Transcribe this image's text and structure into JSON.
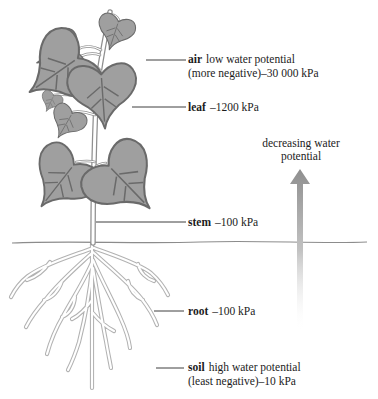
{
  "diagram": {
    "arrow_label": {
      "line1": "decreasing water",
      "line2": "potential"
    },
    "labels": {
      "air": {
        "term": "air",
        "rest": "low water potential",
        "line2": "(more negative)–30 000 kPa"
      },
      "leaf": {
        "term": "leaf",
        "rest": "–1200 kPa"
      },
      "stem": {
        "term": "stem",
        "rest": "–100 kPa"
      },
      "root": {
        "term": "root",
        "rest": "–100 kPa"
      },
      "soil": {
        "term": "soil",
        "rest": "high water potential",
        "line2": "(least negative)–10 kPa"
      }
    },
    "colors": {
      "background": "#ffffff",
      "leaf_fill": "#9f9f9f",
      "leaf_outline": "#6a6a6a",
      "stem_stroke": "#8f8f8f",
      "root_stroke": "#b2b2b2",
      "arrow_gray": "#8f8f8f",
      "ground_line": "#8c8c8c",
      "leader_line": "#3f3f3f",
      "text": "#1c1c1c"
    }
  }
}
